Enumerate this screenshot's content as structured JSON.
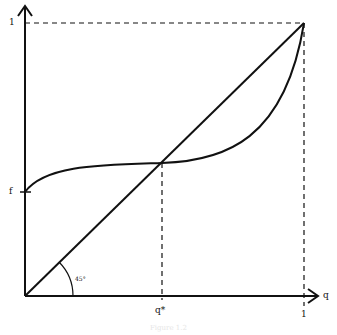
{
  "diagram": {
    "axes": {
      "x_label": "q",
      "y_label": "",
      "x_ticks": [
        "q*",
        "1"
      ],
      "y_ticks": [
        "f",
        "1"
      ]
    },
    "angle_label": "45°",
    "curves": [
      {
        "name": "45-degree-line",
        "from": [
          0,
          0
        ],
        "to": [
          1,
          1
        ]
      },
      {
        "name": "s-curve",
        "start": "f",
        "passes_through": "q*",
        "end": [
          1,
          1
        ]
      }
    ],
    "guides": [
      "dashed vertical at q*",
      "dashed vertical at q=1",
      "dashed horizontal at y=1"
    ],
    "caption": "Figure 1.2"
  },
  "colors": {
    "stroke": "#111111",
    "background": "#ffffff"
  }
}
